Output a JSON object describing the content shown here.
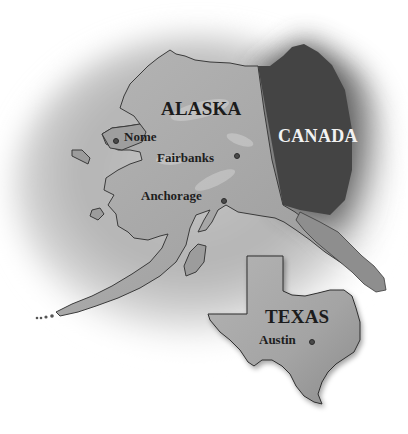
{
  "map": {
    "style": "grayscale shaded relief",
    "background_color": "#ffffff",
    "ocean_color": "#b8b8b8",
    "land_color": "#a9a9a9",
    "canada_color": "#4a4a4a",
    "regions": [
      {
        "id": "alaska",
        "label": "ALASKA",
        "type": "state"
      },
      {
        "id": "canada",
        "label": "CANADA",
        "type": "country"
      },
      {
        "id": "texas",
        "label": "TEXAS",
        "type": "state"
      }
    ],
    "cities": [
      {
        "id": "nome",
        "label": "Nome",
        "region": "alaska"
      },
      {
        "id": "fairbanks",
        "label": "Fairbanks",
        "region": "alaska"
      },
      {
        "id": "anchorage",
        "label": "Anchorage",
        "region": "alaska"
      },
      {
        "id": "austin",
        "label": "Austin",
        "region": "texas"
      }
    ]
  }
}
